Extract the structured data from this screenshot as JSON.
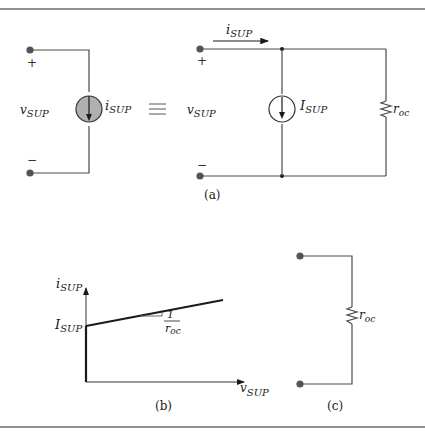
{
  "figure": {
    "panel_a": {
      "caption": "(a)",
      "left_circuit": {
        "voltage_label": "v",
        "voltage_sub": "SUP",
        "plus_sign": "+",
        "minus_sign": "−",
        "source_label": "i",
        "source_sub": "SUP"
      },
      "equivalence_symbol": "≡",
      "right_circuit": {
        "voltage_label": "v",
        "voltage_sub": "SUP",
        "plus_sign": "+",
        "minus_sign": "−",
        "current_arrow_label": "i",
        "current_arrow_sub": "SUP",
        "source_label": "I",
        "source_sub": "SUP",
        "resistor_label": "r",
        "resistor_sub": "oc"
      }
    },
    "panel_b": {
      "caption": "(b)",
      "y_axis_label": "i",
      "y_axis_sub": "SUP",
      "x_axis_label": "v",
      "x_axis_sub": "SUP",
      "intercept_label": "I",
      "intercept_sub": "SUP",
      "slope_numerator": "1",
      "slope_denominator": "r",
      "slope_denominator_sub": "oc"
    },
    "panel_c": {
      "caption": "(c)",
      "resistor_label": "r",
      "resistor_sub": "oc"
    },
    "colors": {
      "wire": "#4a4a4a",
      "terminal": "#555555",
      "dependent_source_fill": "#b0b0b0",
      "ink": "#1a1a1a"
    }
  }
}
